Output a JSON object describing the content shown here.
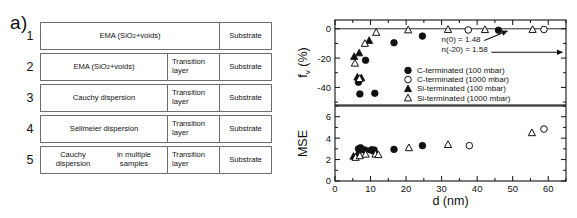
{
  "figure": {
    "panel_a_label": "a)",
    "panel_b_label": "b)"
  },
  "panel_a": {
    "caption": "Optical model structures",
    "rows": [
      {
        "number": "1",
        "layers": [
          "EMA (SiO2+voids)",
          "Substrate"
        ],
        "main": "EMA (SiO",
        "main_sub": "2",
        "main_tail": "+voids)",
        "transition": "",
        "substrate": "Substrate",
        "has_transition": false
      },
      {
        "number": "2",
        "layers": [
          "EMA (SiO2+voids)",
          "Transition layer",
          "Substrate"
        ],
        "main": "EMA (SiO",
        "main_sub": "2",
        "main_tail": "+voids)",
        "transition": "Transition layer",
        "substrate": "Substrate",
        "has_transition": true
      },
      {
        "number": "3",
        "layers": [
          "Cauchy dispersion",
          "Transition layer",
          "Substrate"
        ],
        "main": "Cauchy dispersion",
        "main_sub": "",
        "main_tail": "",
        "transition": "Transition layer",
        "substrate": "Substrate",
        "has_transition": true
      },
      {
        "number": "4",
        "layers": [
          "Sellmeier dispersion",
          "Transition layer",
          "Substrate"
        ],
        "main": "Sellmeier dispersion",
        "main_sub": "",
        "main_tail": "",
        "transition": "Transition layer",
        "substrate": "Substrate",
        "has_transition": true
      },
      {
        "number": "5",
        "layers": [
          "Cauchy dispersion in multiple samples",
          "Transition layer",
          "Substrate"
        ],
        "main": "Cauchy dispersion",
        "main_sub": "",
        "main_tail": "in multiple samples",
        "transition": "Transition layer",
        "substrate": "Substrate",
        "has_transition": true
      }
    ]
  },
  "chart_data": [
    {
      "id": "upper",
      "type": "scatter",
      "title": "",
      "xlabel": "d (nm)",
      "ylabel": "f_v (%)",
      "ylabel_base": "f",
      "ylabel_sub": "v",
      "ylabel_unit": " (%)",
      "xlim": [
        0,
        65
      ],
      "ylim": [
        -52,
        6
      ],
      "yticks": [
        0,
        -20,
        -40
      ],
      "ytick_labels": [
        "0",
        "-20",
        "-40"
      ],
      "xticks": [
        0,
        10,
        20,
        30,
        40,
        50,
        60
      ],
      "grid": false,
      "zero_line": 0,
      "annotations": [
        {
          "text": "n(0) = 1.48",
          "x": 30,
          "y": -9
        },
        {
          "text": "n(-20) = 1.58",
          "x": 30,
          "y": -16
        }
      ],
      "series": [
        {
          "name": "C-terminated (100 mbar)",
          "marker": "filled-circle",
          "points": [
            [
              6.6,
              -36.5
            ],
            [
              7.0,
              -44.5
            ],
            [
              8.6,
              -21.5
            ],
            [
              11.2,
              -44.0
            ],
            [
              16.6,
              -9.5
            ],
            [
              24.6,
              -5.0
            ],
            [
              46.0,
              -1.0
            ]
          ]
        },
        {
          "name": "C-terminated (1000 mbar)",
          "marker": "open-circle",
          "points": [
            [
              37.5,
              -0.8
            ],
            [
              58.8,
              -0.5
            ]
          ]
        },
        {
          "name": "Si-terminated (100 mbar)",
          "marker": "filled-triangle",
          "points": [
            [
              5.4,
              -19.0
            ],
            [
              6.3,
              -33.0
            ],
            [
              6.8,
              -16.5
            ],
            [
              7.4,
              -33.5
            ],
            [
              9.6,
              -8.0
            ]
          ]
        },
        {
          "name": "Si-terminated (1000 mbar)",
          "marker": "open-triangle",
          "points": [
            [
              5.6,
              -23.5
            ],
            [
              6.9,
              -34.0
            ],
            [
              8.4,
              -10.0
            ],
            [
              11.6,
              -2.5
            ],
            [
              20.6,
              -0.8
            ],
            [
              31.8,
              -0.5
            ],
            [
              42.2,
              -0.6
            ],
            [
              55.6,
              -0.5
            ]
          ]
        }
      ]
    },
    {
      "id": "lower",
      "type": "scatter",
      "title": "",
      "xlabel": "d (nm)",
      "ylabel": "MSE",
      "xlim": [
        0,
        65
      ],
      "ylim": [
        0,
        7
      ],
      "yticks": [
        0,
        2,
        4,
        6
      ],
      "ytick_labels": [
        "0",
        "2",
        "4",
        "6"
      ],
      "xticks": [
        0,
        10,
        20,
        30,
        40,
        50,
        60
      ],
      "xtick_labels": [
        "0",
        "10",
        "20",
        "30",
        "40",
        "50",
        "60"
      ],
      "grid": false,
      "series": [
        {
          "name": "C-terminated (100 mbar)",
          "marker": "filled-circle",
          "points": [
            [
              6.6,
              3.0
            ],
            [
              7.2,
              3.1
            ],
            [
              8.4,
              2.9
            ],
            [
              10.2,
              2.9
            ],
            [
              11.0,
              2.9
            ],
            [
              16.6,
              2.95
            ],
            [
              24.6,
              3.3
            ]
          ]
        },
        {
          "name": "C-terminated (1000 mbar)",
          "marker": "open-circle",
          "points": [
            [
              37.8,
              3.3
            ],
            [
              58.8,
              4.85
            ]
          ]
        },
        {
          "name": "Si-terminated (100 mbar)",
          "marker": "filled-triangle",
          "points": [
            [
              5.2,
              2.3
            ],
            [
              6.2,
              2.45
            ],
            [
              7.4,
              2.9
            ],
            [
              10.4,
              2.9
            ],
            [
              11.2,
              2.8
            ]
          ]
        },
        {
          "name": "Si-terminated (1000 mbar)",
          "marker": "open-triangle",
          "points": [
            [
              5.8,
              2.2
            ],
            [
              7.0,
              2.35
            ],
            [
              8.6,
              2.5
            ],
            [
              11.4,
              2.5
            ],
            [
              12.2,
              2.45
            ],
            [
              20.8,
              3.1
            ],
            [
              31.8,
              3.4
            ],
            [
              55.4,
              4.5
            ]
          ]
        }
      ]
    }
  ],
  "legend": {
    "position": "upper-panel-center",
    "entries": [
      {
        "marker": "filled-circle",
        "label": "C-terminated (100 mbar)"
      },
      {
        "marker": "open-circle",
        "label": "C-terminated (1000 mbar)"
      },
      {
        "marker": "filled-triangle",
        "label": "Si-terminated (100 mbar)"
      },
      {
        "marker": "open-triangle",
        "label": "Si-terminated (1000 mbar)"
      }
    ]
  },
  "colors": {
    "ink": "#111111",
    "frame": "#111111",
    "table_border": "#6e6e6e",
    "background": "#ffffff"
  }
}
